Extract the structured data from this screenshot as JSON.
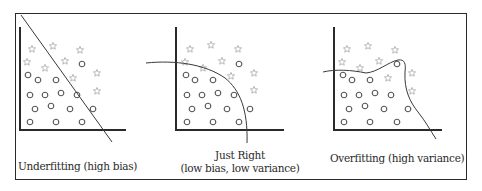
{
  "colors": {
    "frame": "#2a2a2a",
    "axis": "#2a2a2a",
    "boundary": "#3a3a3a",
    "circle": "#555555",
    "star": "#b8b8b8"
  },
  "panels": [
    {
      "id": "underfitting",
      "caption_line1": "Underfitting (high bias)",
      "caption_line2": "",
      "boundary_type": "straight line"
    },
    {
      "id": "just-right",
      "caption_line1": "Just Right",
      "caption_line2": "(low bias, low variance)",
      "boundary_type": "smooth curve"
    },
    {
      "id": "overfitting",
      "caption_line1": "Overfitting (high variance)",
      "caption_line2": "",
      "boundary_type": "wiggly curve"
    }
  ],
  "legend_semantics": {
    "star": "class A (star markers)",
    "circle": "class B (circle markers)"
  }
}
